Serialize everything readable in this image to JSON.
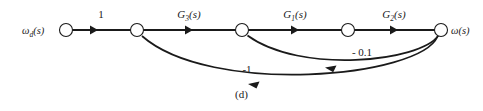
{
  "figure": {
    "caption": "(d)",
    "type": "signal-flow-graph",
    "input_label": "ω",
    "input_label_sub": "d",
    "input_label_arg": "(s)",
    "output_label": "ω",
    "output_label_arg": "(s)",
    "colors": {
      "ink": "#1a1a1a",
      "background": "#ffffff"
    }
  },
  "nodes": [
    {
      "id": "n1",
      "name": "input-node",
      "x": 66,
      "y": 30,
      "r": 6.5
    },
    {
      "id": "n2",
      "name": "summing-node-2",
      "x": 137,
      "y": 30,
      "r": 6.5
    },
    {
      "id": "n3",
      "name": "summing-node-3",
      "x": 242,
      "y": 30,
      "r": 6.5
    },
    {
      "id": "n4",
      "name": "intermediate-node-4",
      "x": 348,
      "y": 30,
      "r": 6.5
    },
    {
      "id": "n5",
      "name": "output-node",
      "x": 441,
      "y": 30,
      "r": 6.5
    }
  ],
  "forward_branches": [
    {
      "from": "n1",
      "to": "n2",
      "gain": "1",
      "italic": false,
      "label_x": 101,
      "label_y": 18
    },
    {
      "from": "n2",
      "to": "n3",
      "gain": "G",
      "sub": "3",
      "arg": "(s)",
      "italic": true,
      "label_x": 189,
      "label_y": 18
    },
    {
      "from": "n3",
      "to": "n4",
      "gain": "G",
      "sub": "1",
      "arg": "(s)",
      "italic": true,
      "label_x": 295,
      "label_y": 18
    },
    {
      "from": "n4",
      "to": "n5",
      "gain": "G",
      "sub": "2",
      "arg": "(s)",
      "italic": true,
      "label_x": 394,
      "label_y": 18
    }
  ],
  "feedback_branches": [
    {
      "from": "n5",
      "to": "n3",
      "gain": "- 0.1",
      "label_x": 362,
      "label_y": 56
    },
    {
      "from": "n5",
      "to": "n2",
      "gain": "-1",
      "label_x": 247,
      "label_y": 72
    }
  ]
}
